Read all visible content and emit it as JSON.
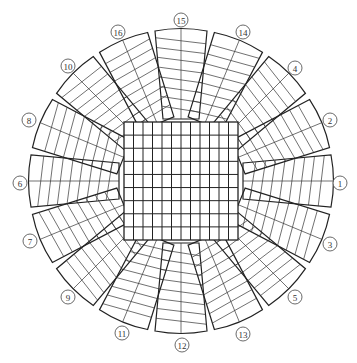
{
  "diagram": {
    "center": [
      181,
      181
    ],
    "center_grid": {
      "x": 124,
      "y": 122,
      "width": 114,
      "height": 118,
      "cols": 9,
      "rows": 9
    },
    "sectors": [
      {
        "id": "1",
        "label": "1",
        "angle": 0,
        "label_pos": [
          340,
          183
        ]
      },
      {
        "id": "3",
        "label": "3",
        "angle": 22.5,
        "label_pos": [
          330,
          244
        ]
      },
      {
        "id": "5",
        "label": "5",
        "angle": 45,
        "label_pos": [
          295,
          297
        ]
      },
      {
        "id": "13",
        "label": "13",
        "angle": 67.5,
        "label_pos": [
          243,
          334
        ]
      },
      {
        "id": "12",
        "label": "12",
        "angle": 90,
        "label_pos": [
          182,
          345
        ]
      },
      {
        "id": "11",
        "label": "11",
        "angle": 112.5,
        "label_pos": [
          122,
          333
        ]
      },
      {
        "id": "9",
        "label": "9",
        "angle": 135,
        "label_pos": [
          68,
          297
        ]
      },
      {
        "id": "7",
        "label": "7",
        "angle": 157.5,
        "label_pos": [
          30,
          241
        ]
      },
      {
        "id": "6",
        "label": "6",
        "angle": 180,
        "label_pos": [
          20,
          183
        ]
      },
      {
        "id": "8",
        "label": "8",
        "angle": 202.5,
        "label_pos": [
          29,
          120
        ]
      },
      {
        "id": "10",
        "label": "10",
        "angle": 225,
        "label_pos": [
          68,
          66
        ]
      },
      {
        "id": "16",
        "label": "16",
        "angle": 247.5,
        "label_pos": [
          118,
          32
        ]
      },
      {
        "id": "15",
        "label": "15",
        "angle": 270,
        "label_pos": [
          181,
          20
        ]
      },
      {
        "id": "14",
        "label": "14",
        "angle": 292.5,
        "label_pos": [
          243,
          32
        ]
      },
      {
        "id": "4",
        "label": "4",
        "angle": 315,
        "label_pos": [
          295,
          68
        ]
      },
      {
        "id": "2",
        "label": "2",
        "angle": 337.5,
        "label_pos": [
          330,
          120
        ]
      }
    ],
    "sector_geometry": {
      "inner_radius": 62,
      "outer_radius": 150,
      "inner_half_width": 18,
      "outer_half_width": 26,
      "cross_lines": 8
    },
    "colors": {
      "line": "#222222",
      "background": "#ffffff"
    }
  }
}
